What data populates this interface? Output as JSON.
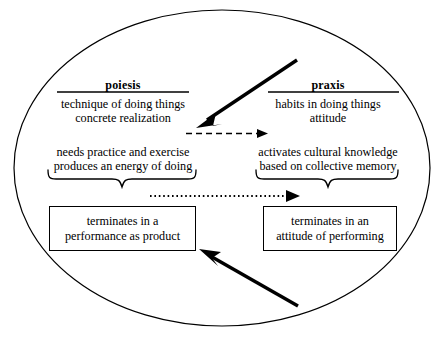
{
  "diagram": {
    "shape": "ellipse",
    "colors": {
      "stroke": "#000000",
      "background": "#ffffff"
    },
    "columns": {
      "left": {
        "heading": "poiesis",
        "block_one": {
          "line1": "technique of doing things",
          "line2": "concrete realization"
        },
        "block_two": {
          "line1": "needs practice and exercise",
          "line2": "produces an energy of doing"
        },
        "outcome_box": {
          "line1": "terminates in a",
          "line2": "performance as product"
        }
      },
      "right": {
        "heading": "praxis",
        "block_one": {
          "line1": "habits in doing things",
          "line2": "attitude"
        },
        "block_two": {
          "line1": "activates cultural knowledge",
          "line2": "based on collective memory"
        },
        "outcome_box": {
          "line1": "terminates in an",
          "line2": "attitude of performing"
        }
      }
    },
    "connectors": [
      {
        "name": "thick-arrow-top",
        "style": "solid-thick",
        "direction": "from upper-right to lower-left",
        "from": [
          295,
          62
        ],
        "to": [
          199,
          126
        ]
      },
      {
        "name": "dashed-arrow-middle",
        "style": "dashed",
        "direction": "left-to-right",
        "from": [
          186,
          133
        ],
        "to": [
          265,
          133
        ]
      },
      {
        "name": "dotted-arrow-lower",
        "style": "dotted",
        "direction": "left-to-right",
        "from": [
          150,
          196
        ],
        "to": [
          296,
          196
        ]
      },
      {
        "name": "thick-arrow-bottom",
        "style": "solid-thick",
        "direction": "from lower-right to upper-left",
        "from": [
          296,
          305
        ],
        "to": [
          200,
          250
        ]
      }
    ],
    "braces": [
      {
        "name": "brace-left",
        "x1": 48,
        "x2": 196,
        "y": 178
      },
      {
        "name": "brace-right",
        "x1": 256,
        "x2": 396,
        "y": 178
      }
    ]
  }
}
